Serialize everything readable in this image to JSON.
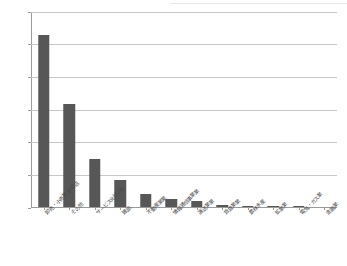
{
  "chart_data": {
    "type": "bar",
    "title": "",
    "subtitle": "",
    "xlabel": "",
    "ylabel": "",
    "categories": [
      "卸売・小売業,飲食店",
      "その他",
      "サービス化比2業",
      "建設",
      "不動産業業",
      "情報通信事業業",
      "運送業業",
      "賃貸業業",
      "農林水産",
      "鉱業業",
      "電気・ガス業",
      "金融業"
    ],
    "values": [
      2.65,
      1.58,
      0.74,
      0.41,
      0.2,
      0.13,
      0.09,
      0.03,
      0.02,
      0.015,
      0.01,
      0.0
    ],
    "ylim": [
      0.0,
      3.0
    ],
    "yticks": [
      0.0,
      0.5,
      1.0,
      1.5,
      2.0,
      2.5,
      3.0
    ],
    "ytick_labels": [
      "0.0%",
      "0.5%",
      "1.0%",
      "1.5%",
      "2.0%",
      "2.5%",
      "3.0%"
    ],
    "value_unit": "%",
    "grid": true,
    "legend": null,
    "legend_position": "none",
    "bar_color": "#575757",
    "gridline_color": "#c8c8c8",
    "axis_color": "#9a9a9a",
    "text_color": "#4a4a4a"
  }
}
